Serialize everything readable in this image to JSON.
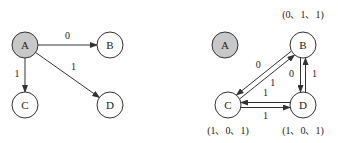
{
  "diagram_left": {
    "nodes": [
      {
        "id": "A",
        "label": "A",
        "highlighted": true
      },
      {
        "id": "B",
        "label": "B",
        "highlighted": false
      },
      {
        "id": "C",
        "label": "C",
        "highlighted": false
      },
      {
        "id": "D",
        "label": "D",
        "highlighted": false
      }
    ],
    "edges": [
      {
        "from": "A",
        "to": "B",
        "label": "0"
      },
      {
        "from": "A",
        "to": "C",
        "label": "1"
      },
      {
        "from": "A",
        "to": "D",
        "label": "1"
      }
    ]
  },
  "diagram_right": {
    "nodes": [
      {
        "id": "A",
        "label": "A",
        "highlighted": true,
        "vector": ""
      },
      {
        "id": "B",
        "label": "B",
        "highlighted": false,
        "vector": "(0、1、1)"
      },
      {
        "id": "C",
        "label": "C",
        "highlighted": false,
        "vector": "(1、0、1)"
      },
      {
        "id": "D",
        "label": "D",
        "highlighted": false,
        "vector": "(1、0、1)"
      }
    ],
    "edges": [
      {
        "from": "B",
        "to": "C",
        "label": "0"
      },
      {
        "from": "C",
        "to": "B",
        "label": "1"
      },
      {
        "from": "B",
        "to": "D",
        "label": "0"
      },
      {
        "from": "D",
        "to": "B",
        "label": "1"
      },
      {
        "from": "C",
        "to": "D",
        "label": "1"
      },
      {
        "from": "D",
        "to": "C",
        "label": "1"
      }
    ]
  },
  "colors": {
    "highlight_fill": "#c8c8c8",
    "node_fill": "#ffffff",
    "stroke": "#333333"
  }
}
